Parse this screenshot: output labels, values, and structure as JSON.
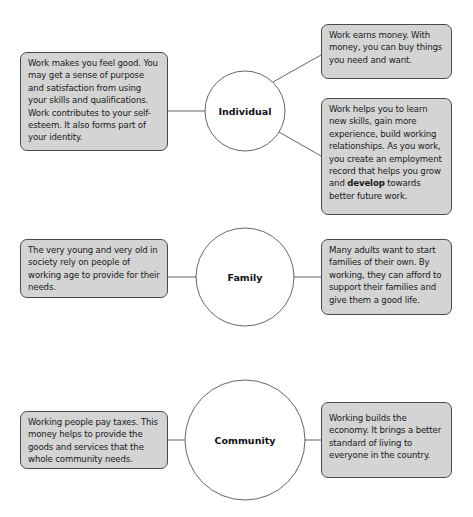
{
  "diagram": {
    "type": "mind-map",
    "theme": "Why people work",
    "colors": {
      "box_fill": "#d4d4d4",
      "box_border": "#4a4a4a",
      "circle_fill": "#ffffff",
      "circle_border": "#555555",
      "connector": "#555555",
      "text": "#1a1a1a"
    },
    "groups": [
      {
        "id": "individual",
        "label": "Individual",
        "left_boxes": [
          {
            "text": "Work makes you feel good. You may get a sense of purpose and satisfaction from using your skills and qualifications. Work contributes to your self-esteem. It also forms part of your identity."
          }
        ],
        "right_boxes": [
          {
            "text": "Work earns money. With money, you can buy things you need and want."
          },
          {
            "text_before_bold": "Work helps you to learn new skills, gain more experience, build working relationships. As you work, you create an employment record that helps you grow and ",
            "bold": "develop",
            "text_after_bold": " towards better future work."
          }
        ]
      },
      {
        "id": "family",
        "label": "Family",
        "left_boxes": [
          {
            "text": "The very young and very old in society rely on people of working age to provide for their needs."
          }
        ],
        "right_boxes": [
          {
            "text": "Many adults want to start families of their own. By working, they can afford to support their families and give them a good life."
          }
        ]
      },
      {
        "id": "community",
        "label": "Community",
        "left_boxes": [
          {
            "text": "Working people pay taxes. This money helps to provide the goods and services that the whole community needs."
          }
        ],
        "right_boxes": [
          {
            "text": "Working builds the economy. It brings a better standard of living to everyone in the country."
          }
        ]
      }
    ],
    "edges": [
      {
        "from": "individual",
        "to": "individual.left.0"
      },
      {
        "from": "individual",
        "to": "individual.right.0"
      },
      {
        "from": "individual",
        "to": "individual.right.1"
      },
      {
        "from": "family",
        "to": "family.left.0"
      },
      {
        "from": "family",
        "to": "family.right.0"
      },
      {
        "from": "community",
        "to": "community.left.0"
      },
      {
        "from": "community",
        "to": "community.right.0"
      }
    ]
  }
}
